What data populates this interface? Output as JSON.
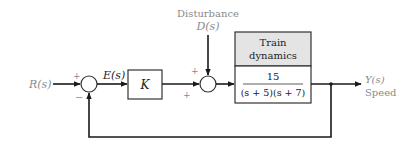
{
  "diagram": {
    "type": "block-diagram",
    "input": {
      "label": "R(s)"
    },
    "summing_junction_1": {
      "signs": {
        "top": "+",
        "bottom": "−"
      }
    },
    "error_signal": {
      "label": "E(s)"
    },
    "controller": {
      "label": "K"
    },
    "disturbance": {
      "title": "Disturbance",
      "label": "D(s)"
    },
    "summing_junction_2": {
      "signs": {
        "top": "+",
        "bottom": "+"
      }
    },
    "plant": {
      "title_line1": "Train",
      "title_line2": "dynamics",
      "numerator": "15",
      "denominator": "(s + 5)(s + 7)"
    },
    "output": {
      "label": "Y(s)",
      "description": "Speed"
    },
    "colors": {
      "header_fill": "#e4e4e4",
      "line": "#1a1a1a",
      "label_gray": "#8a8a8a"
    }
  }
}
